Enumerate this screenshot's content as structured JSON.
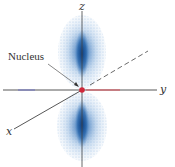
{
  "diagram": {
    "type": "p-orbital electron density (pz)",
    "labels": {
      "z_axis": "z",
      "y_axis": "y",
      "x_axis": "x",
      "nucleus": "Nucleus"
    },
    "colors": {
      "axis": "#444444",
      "lobe_light": "#b9d3ec",
      "lobe_dense": "#1f5fa6",
      "nucleus": "#d0283a",
      "y_axis_accent": "#e0505a",
      "y_axis_left_tint": "#6a6fc0"
    }
  }
}
